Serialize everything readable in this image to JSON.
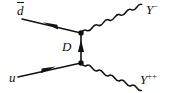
{
  "figure": {
    "kind": "feynman-diagram",
    "width": 181,
    "height": 93,
    "background_color": "#ffffff",
    "line_color": "#111111"
  },
  "labels": {
    "incoming_antidown": {
      "symbol": "d",
      "has_overbar": true,
      "text": "d̄"
    },
    "incoming_up": {
      "symbol": "u",
      "text": "u"
    },
    "propagator": {
      "symbol": "D",
      "text": "D"
    },
    "outgoing_y_minus": {
      "symbol": "Y",
      "superscript": "−",
      "text": "Y−"
    },
    "outgoing_y_plusplus": {
      "symbol": "Y",
      "superscript": "++",
      "text": "Y++"
    }
  },
  "geometry": {
    "vertex_top": {
      "x": 81,
      "y": 33
    },
    "vertex_bottom": {
      "x": 81,
      "y": 63
    },
    "vertex_radius": 2.6,
    "incoming_antidown_line": {
      "x1": 22,
      "y1": 19,
      "x2": 81,
      "y2": 33
    },
    "incoming_up_line": {
      "x1": 18,
      "y1": 77,
      "x2": 81,
      "y2": 63
    },
    "propagator_line": {
      "x1": 81,
      "y1": 63,
      "x2": 81,
      "y2": 33
    },
    "wavy_top": {
      "x1": 81,
      "y1": 33,
      "x2": 141,
      "y2": 16,
      "cycles": 7,
      "amplitude": 3.1
    },
    "wavy_bottom": {
      "x1": 81,
      "y1": 63,
      "x2": 140,
      "y2": 79,
      "cycles": 7,
      "amplitude": 3.1
    },
    "arrow_antidown": {
      "x": 50,
      "y": 26,
      "direction": "up-left"
    },
    "arrow_up": {
      "x": 48,
      "y": 70,
      "direction": "up-right"
    },
    "arrow_propagator": {
      "x": 81,
      "y": 48,
      "direction": "up"
    }
  }
}
